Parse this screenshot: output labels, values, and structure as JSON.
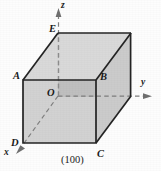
{
  "figure": {
    "caption": "(100)",
    "colors": {
      "background": "#fdfdfd",
      "line": "#1f1f1f",
      "face_front": "#d2d2d2",
      "face_right": "#cbcbcb",
      "face_top": "#d9d9d9",
      "face_inner_quadrant": "#bdbdbd",
      "dashed": "#8a8a8a",
      "label": "#1a1a1a"
    },
    "vertex_labels": [
      {
        "name": "vertex-label-a",
        "text": "A",
        "x": 13,
        "y": 71
      },
      {
        "name": "vertex-label-b",
        "text": "B",
        "x": 100,
        "y": 72
      },
      {
        "name": "vertex-label-c",
        "text": "C",
        "x": 97,
        "y": 150
      },
      {
        "name": "vertex-label-d",
        "text": "D",
        "x": 11,
        "y": 139
      },
      {
        "name": "vertex-label-e",
        "text": "E",
        "x": 49,
        "y": 25
      },
      {
        "name": "vertex-label-o",
        "text": "O",
        "x": 47,
        "y": 88
      }
    ],
    "axis_labels": [
      {
        "name": "axis-label-z",
        "text": "z",
        "x": 61,
        "y": 2
      },
      {
        "name": "axis-label-y",
        "text": "y",
        "x": 142,
        "y": 78
      },
      {
        "name": "axis-label-x",
        "text": "x",
        "x": 4,
        "y": 149
      }
    ],
    "geometry": {
      "front_face": "23,80 96,80 96,143 23,143",
      "top_face": "23,80 58,33 131,33 96,80",
      "right_face": "96,80 131,33 131,96 96,143",
      "inner_quadrant": "58,80 96,80 96,96 58,96",
      "edge_a_to_e": "23,80 58,33",
      "edge_b_to_rear_top": "96,80 131,33",
      "edge_c_to_rear_bottom": "96,143 131,96",
      "axis_z": "58,96 58,12",
      "axis_y": "58,96 150,96",
      "axis_x": "58,96 18,152",
      "hidden_rear_vertical": "58,33 58,96",
      "hidden_o_to_b_edge": "58,96 96,96"
    }
  }
}
